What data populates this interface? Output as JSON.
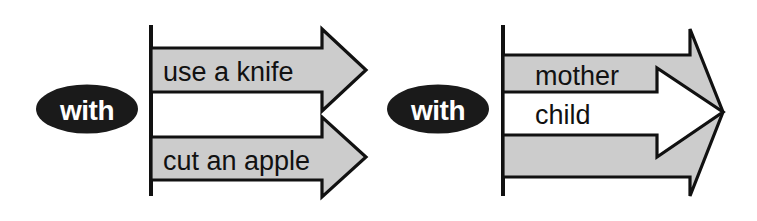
{
  "diagram": {
    "type": "arrow-band-diagram",
    "background_color": "#ffffff",
    "groups": [
      {
        "id": "left",
        "relation_label": "with",
        "relation_shape": "ellipse",
        "relation_fill": "#1a1a1a",
        "relation_text_color": "#ffffff",
        "arrow_style": "two-separate-gray-arrows",
        "bands": [
          {
            "text": "use a knife",
            "fill": "#cccccc",
            "kind": "arrow"
          },
          {
            "text": "",
            "fill": "#ffffff",
            "kind": "gap"
          },
          {
            "text": "cut an apple",
            "fill": "#cccccc",
            "kind": "arrow"
          }
        ]
      },
      {
        "id": "right",
        "relation_label": "with",
        "relation_shape": "ellipse",
        "relation_fill": "#1a1a1a",
        "relation_text_color": "#ffffff",
        "arrow_style": "gray-arrow-with-nested-white-arrow",
        "bands": [
          {
            "text": "mother",
            "fill": "#cccccc",
            "kind": "arrow"
          },
          {
            "text": "child",
            "fill": "#ffffff",
            "kind": "arrow"
          },
          {
            "text": "",
            "fill": "#cccccc",
            "kind": "arrow"
          }
        ]
      }
    ],
    "colors": {
      "gray_fill": "#cccccc",
      "white_fill": "#ffffff",
      "stroke": "#111111",
      "ellipse_fill": "#1a1a1a",
      "ellipse_text": "#ffffff"
    }
  }
}
